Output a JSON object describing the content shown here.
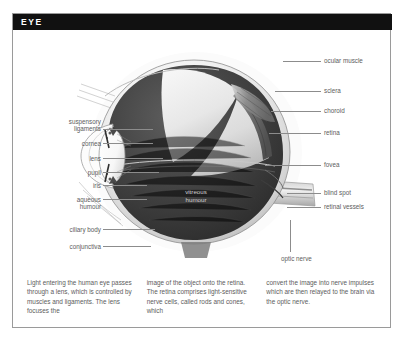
{
  "figure": {
    "title": "EYE",
    "inner_label": "vitreous\nhumour",
    "inner_label_line1": "vitreous",
    "inner_label_line2": "humour"
  },
  "labels_left": [
    {
      "id": "suspensory-ligaments",
      "line1": "suspensory",
      "line2": "ligaments",
      "x": 26,
      "y": 88,
      "lead_x": 88,
      "lead_w": 52,
      "lead_y": 99
    },
    {
      "id": "cornea",
      "line1": "cornea",
      "line2": "",
      "x": 26,
      "y": 108,
      "lead_x": 88,
      "lead_w": 52,
      "lead_y": 112
    },
    {
      "id": "lens",
      "line1": "lens",
      "line2": "",
      "x": 26,
      "y": 123,
      "lead_x": 88,
      "lead_w": 62,
      "lead_y": 127
    },
    {
      "id": "pupil",
      "line1": "pupil",
      "line2": "",
      "x": 26,
      "y": 138,
      "lead_x": 88,
      "lead_w": 58,
      "lead_y": 142
    },
    {
      "id": "iris",
      "line1": "iris",
      "line2": "",
      "x": 26,
      "y": 150,
      "lead_x": 88,
      "lead_w": 48,
      "lead_y": 154
    },
    {
      "id": "aqueous-humour",
      "line1": "aqueous",
      "line2": "humour",
      "x": 26,
      "y": 165,
      "lead_x": 88,
      "lead_w": 46,
      "lead_y": 169
    },
    {
      "id": "ciliary-body",
      "line1": "ciliary body",
      "line2": "",
      "x": 26,
      "y": 195,
      "lead_x": 88,
      "lead_w": 52,
      "lead_y": 199
    },
    {
      "id": "conjunctiva",
      "line1": "conjunctiva",
      "line2": "",
      "x": 26,
      "y": 212,
      "lead_x": 88,
      "lead_w": 48,
      "lead_y": 216
    }
  ],
  "labels_right": [
    {
      "id": "ocular-muscle",
      "text": "ocular muscle",
      "x": 311,
      "y": 26,
      "lead_x": 270,
      "lead_w": 38,
      "lead_y": 30
    },
    {
      "id": "sclera",
      "text": "sclera",
      "x": 311,
      "y": 56,
      "lead_x": 262,
      "lead_w": 46,
      "lead_y": 60
    },
    {
      "id": "choroid",
      "text": "choroid",
      "x": 311,
      "y": 76,
      "lead_x": 258,
      "lead_w": 50,
      "lead_y": 80
    },
    {
      "id": "retina",
      "text": "retina",
      "x": 311,
      "y": 98,
      "lead_x": 256,
      "lead_w": 52,
      "lead_y": 102
    },
    {
      "id": "fovea",
      "text": "fovea",
      "x": 311,
      "y": 130,
      "lead_x": 252,
      "lead_w": 56,
      "lead_y": 134
    },
    {
      "id": "blind-spot",
      "text": "blind spot",
      "x": 311,
      "y": 158,
      "lead_x": 274,
      "lead_w": 34,
      "lead_y": 162
    },
    {
      "id": "retinal-vessels",
      "text": "retinal vessels",
      "x": 311,
      "y": 172,
      "lead_x": 274,
      "lead_w": 34,
      "lead_y": 176
    },
    {
      "id": "optic-nerve",
      "text": "optic nerve",
      "x": 270,
      "y": 228,
      "lead_x": 0,
      "lead_w": 0,
      "lead_y": 0
    }
  ],
  "caption": {
    "column1": "Light entering the human eye passes through a lens, which is controlled by muscles and ligaments. The lens focuses the",
    "column2": "image of the object onto the retina. The retina comprises light-sensitive nerve cells, called rods and cones, which",
    "column3": "convert the image into nerve impulses which are then relayed to the brain via the optic nerve."
  },
  "colors": {
    "title_bar": "#111111",
    "title_text": "#ffffff",
    "label_text": "#5d5d5d",
    "leader_line": "#8c8c8c",
    "border": "#9a9a9a",
    "vitreous_dark": "#3a3a3a",
    "sclera_light": "#e8e8e8",
    "inner_label_text": "#cfcfcf"
  }
}
